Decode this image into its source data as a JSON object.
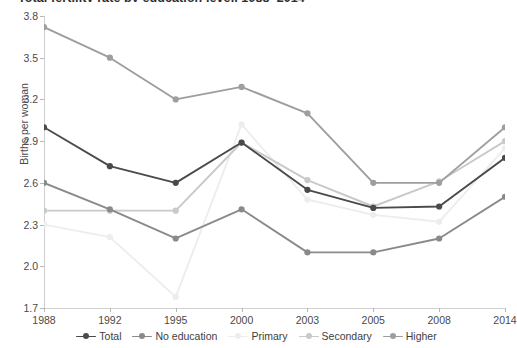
{
  "chart_data": {
    "type": "line",
    "title": "Total fertility rate by education level, 1988–2014",
    "xlabel": "",
    "ylabel": "Births per woman",
    "categories": [
      "1988",
      "1992",
      "1995",
      "2000",
      "2003",
      "2005",
      "2008",
      "2014"
    ],
    "x_tick_labels": [
      "1988",
      "1992",
      "1995",
      "2000",
      "2003",
      "2005",
      "2008",
      "2014"
    ],
    "y_tick_labels": [
      "3.8",
      "3.5",
      "3.2",
      "2.9",
      "2.6",
      "2.3",
      "2.0",
      "1.7"
    ],
    "y_tick_values": [
      3.8,
      3.5,
      3.2,
      2.9,
      2.6,
      2.3,
      2.0,
      1.7
    ],
    "ylim": [
      1.7,
      3.8
    ],
    "grid": false,
    "legend_position": "bottom",
    "series": [
      {
        "name": "Total",
        "color": "#4a4a4a",
        "values": [
          3.0,
          2.72,
          2.6,
          2.89,
          2.55,
          2.42,
          2.43,
          2.78
        ]
      },
      {
        "name": "No education",
        "color": "#8a8a8a",
        "values": [
          2.6,
          2.41,
          2.2,
          2.41,
          2.1,
          2.1,
          2.2,
          2.5
        ]
      },
      {
        "name": "Primary",
        "color": "#ededed",
        "values": [
          2.3,
          2.21,
          1.78,
          3.02,
          2.48,
          2.37,
          2.32,
          2.85
        ]
      },
      {
        "name": "Secondary",
        "color": "#c9c9c9",
        "values": [
          2.4,
          2.4,
          2.4,
          2.89,
          2.62,
          2.43,
          2.61,
          2.9
        ]
      },
      {
        "name": "Higher",
        "color": "#9e9e9e",
        "values": [
          3.72,
          3.5,
          3.2,
          3.29,
          3.1,
          2.6,
          2.6,
          3.0
        ]
      }
    ]
  },
  "legend": {
    "items": [
      {
        "label": "Total",
        "color": "#4a4a4a"
      },
      {
        "label": "No education",
        "color": "#8a8a8a"
      },
      {
        "label": "Primary",
        "color": "#ededed"
      },
      {
        "label": "Secondary",
        "color": "#c9c9c9"
      },
      {
        "label": "Higher",
        "color": "#9e9e9e"
      }
    ]
  }
}
